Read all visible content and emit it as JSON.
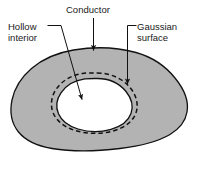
{
  "figure": {
    "name": "hollow-conductor-gaussian-surface-diagram",
    "width": 197,
    "height": 172,
    "background_color": "#ffffff"
  },
  "labels": {
    "hollow_interior": {
      "line1": "Hollow",
      "line2": "interior"
    },
    "conductor": {
      "line1": "Conductor"
    },
    "gaussian_surface": {
      "line1": "Gaussian",
      "line2": "surface"
    }
  },
  "shapes": {
    "conductor": {
      "fill_color": "#b3b3b3",
      "stroke_color": "#111111"
    },
    "cavity": {
      "fill_color": "#ffffff",
      "stroke_color": "#111111"
    },
    "gaussian_surface": {
      "stroke_color": "#111111",
      "style": "dashed"
    }
  },
  "leaders": {
    "stroke_color": "#111111"
  }
}
